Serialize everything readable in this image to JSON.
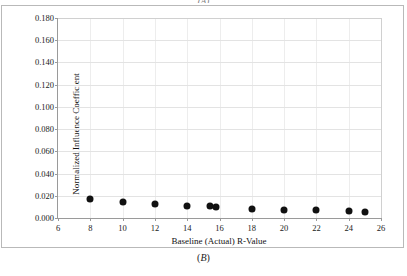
{
  "figure": {
    "caption_top": "(A)",
    "caption_bottom": "(B)"
  },
  "chart_data": {
    "type": "scatter",
    "title": "",
    "subtitle": "",
    "xlabel": "Baseline (Actual) R-Value",
    "ylabel": "Normalized Influence Coefficient",
    "xlim": [
      6,
      26
    ],
    "ylim": [
      0.0,
      0.18
    ],
    "xticks": [
      6,
      8,
      10,
      12,
      14,
      16,
      18,
      20,
      22,
      24,
      26
    ],
    "xtick_labels": [
      "6",
      "8",
      "10",
      "12",
      "14",
      "16",
      "18",
      "20",
      "22",
      "24",
      "26"
    ],
    "yticks": [
      0.0,
      0.02,
      0.04,
      0.06,
      0.08,
      0.1,
      0.12,
      0.14,
      0.16,
      0.18
    ],
    "ytick_labels": [
      "0.000",
      "0.020",
      "0.040",
      "0.060",
      "0.080",
      "0.100",
      "0.120",
      "0.140",
      "0.160",
      "0.180"
    ],
    "grid": "horizontal-and-vertical",
    "legend": null,
    "marker": {
      "shape": "circle",
      "filled": true,
      "color": "#111111",
      "size_px": 7
    },
    "series": [
      {
        "name": "Normalized Influence Coefficient",
        "points": [
          {
            "x": 8,
            "y": 0.0175
          },
          {
            "x": 10,
            "y": 0.0148
          },
          {
            "x": 12,
            "y": 0.013
          },
          {
            "x": 14,
            "y": 0.0112
          },
          {
            "x": 15.4,
            "y": 0.0105
          },
          {
            "x": 15.8,
            "y": 0.0098
          },
          {
            "x": 18,
            "y": 0.0085
          },
          {
            "x": 20,
            "y": 0.007
          },
          {
            "x": 22,
            "y": 0.0072
          },
          {
            "x": 24,
            "y": 0.006
          },
          {
            "x": 25,
            "y": 0.0058
          }
        ]
      }
    ],
    "colors": {
      "marker": "#111111",
      "axis": "#9a9a9a",
      "gridline": "#e3e3e3",
      "gridline_vertical": "#ededed",
      "plot_background": "#ffffff",
      "frame": "#b9b9b9",
      "text": "#1a1a1a"
    }
  }
}
